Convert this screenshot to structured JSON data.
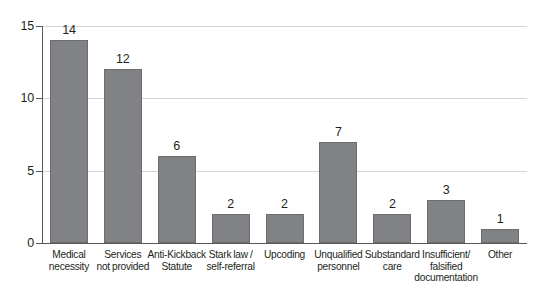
{
  "chart_data": {
    "type": "bar",
    "title": "",
    "subtitle": "",
    "xlabel": "",
    "ylabel": "",
    "categories": [
      "Medical necessity",
      "Services not provided",
      "Anti-Kickback Statute",
      "Stark law / self-referral",
      "Upcoding",
      "Unqualified personnel",
      "Substandard care",
      "Insufficient/ falsified documentation",
      "Other"
    ],
    "category_lines": [
      [
        "Medical",
        "necessity"
      ],
      [
        "Services",
        "not provided"
      ],
      [
        "Anti-Kickback",
        "Statute"
      ],
      [
        "Stark law /",
        "self-referral"
      ],
      [
        "Upcoding"
      ],
      [
        "Unqualified",
        "personnel"
      ],
      [
        "Substandard",
        "care"
      ],
      [
        "Insufficient/",
        "falsified",
        "documentation"
      ],
      [
        "Other"
      ]
    ],
    "values": [
      14,
      12,
      6,
      2,
      2,
      7,
      2,
      3,
      1
    ],
    "value_labels": [
      "14",
      "12",
      "6",
      "2",
      "2",
      "7",
      "2",
      "3",
      "1"
    ],
    "ylim": [
      0,
      15
    ],
    "yticks": [
      0,
      5,
      10,
      15
    ],
    "ytick_labels": [
      "0",
      "5",
      "10",
      "15"
    ],
    "grid": true,
    "grid_axis": "y",
    "legend": "none",
    "colors": {
      "bar_fill": "#808285",
      "bar_stroke": "#6a6c6e",
      "gridline": "#d4d4d4",
      "axis": "#58595b",
      "text": "#231f20",
      "background": "#ffffff"
    }
  }
}
